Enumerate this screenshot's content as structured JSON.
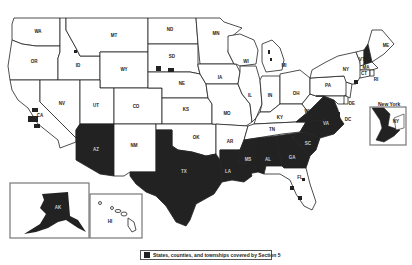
{
  "colors": {
    "covered": "#222222",
    "uncovered": "#ffffff",
    "border": "#222222"
  },
  "legend": {
    "label": "States, counties, and townships covered by Section 5"
  },
  "insets": {
    "new_york": {
      "title": "New York",
      "label": "NY"
    },
    "alaska": {
      "label": "AK"
    },
    "hawaii": {
      "label": "HI"
    }
  },
  "states": {
    "WA": {
      "label": "WA",
      "covered": false
    },
    "OR": {
      "label": "OR",
      "covered": false
    },
    "CA": {
      "label": "CA",
      "covered": "partial"
    },
    "ID": {
      "label": "ID",
      "covered": false
    },
    "NV": {
      "label": "NV",
      "covered": false
    },
    "MT": {
      "label": "MT",
      "covered": false
    },
    "WY": {
      "label": "WY",
      "covered": false
    },
    "UT": {
      "label": "UT",
      "covered": false
    },
    "AZ": {
      "label": "AZ",
      "covered": true
    },
    "CO": {
      "label": "CO",
      "covered": false
    },
    "NM": {
      "label": "NM",
      "covered": false
    },
    "ND": {
      "label": "ND",
      "covered": false
    },
    "SD": {
      "label": "SD",
      "covered": "partial"
    },
    "NE": {
      "label": "NE",
      "covered": false
    },
    "KS": {
      "label": "KS",
      "covered": false
    },
    "OK": {
      "label": "OK",
      "covered": false
    },
    "TX": {
      "label": "TX",
      "covered": true
    },
    "MN": {
      "label": "MN",
      "covered": false
    },
    "IA": {
      "label": "IA",
      "covered": false
    },
    "MO": {
      "label": "MO",
      "covered": false
    },
    "AR": {
      "label": "AR",
      "covered": false
    },
    "LA": {
      "label": "LA",
      "covered": true
    },
    "WI": {
      "label": "WI",
      "covered": false
    },
    "IL": {
      "label": "IL",
      "covered": false
    },
    "MI": {
      "label": "MI",
      "covered": "partial"
    },
    "IN": {
      "label": "IN",
      "covered": false
    },
    "OH": {
      "label": "OH",
      "covered": false
    },
    "KY": {
      "label": "KY",
      "covered": false
    },
    "TN": {
      "label": "TN",
      "covered": false
    },
    "MS": {
      "label": "MS",
      "covered": true
    },
    "AL": {
      "label": "AL",
      "covered": true
    },
    "GA": {
      "label": "GA",
      "covered": true
    },
    "FL": {
      "label": "FL",
      "covered": "partial"
    },
    "SC": {
      "label": "SC",
      "covered": true
    },
    "NC": {
      "label": "NC",
      "covered": "partial"
    },
    "VA": {
      "label": "VA",
      "covered": true
    },
    "WV": {
      "label": "WV",
      "covered": false
    },
    "PA": {
      "label": "PA",
      "covered": false
    },
    "NY": {
      "label": "NY",
      "covered": "partial"
    },
    "VT": {
      "label": "VT",
      "covered": false
    },
    "NH": {
      "label": "NH",
      "covered": "partial"
    },
    "ME": {
      "label": "ME",
      "covered": false
    },
    "MA": {
      "label": "MA",
      "covered": false
    },
    "CT": {
      "label": "CT",
      "covered": false
    },
    "RI": {
      "label": "RI",
      "covered": false
    },
    "NJ": {
      "label": "NJ",
      "covered": false
    },
    "DE": {
      "label": "DE",
      "covered": false
    },
    "MD": {
      "label": "MD",
      "covered": false
    },
    "DC": {
      "label": "DC",
      "covered": false
    },
    "AK": {
      "label": "AK",
      "covered": true
    },
    "HI": {
      "label": "HI",
      "covered": false
    }
  }
}
